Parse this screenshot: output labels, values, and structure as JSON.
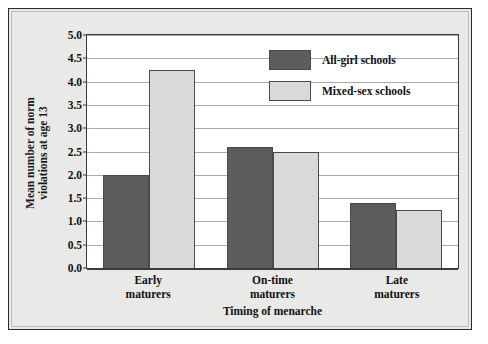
{
  "chart_data": {
    "type": "bar",
    "title": "",
    "xlabel": "Timing of menarche",
    "ylabel": "Mean number of norm\nviolations at age 13",
    "categories": [
      "Early\nmaturers",
      "On-time\nmaturers",
      "Late\nmaturers"
    ],
    "series": [
      {
        "name": "All-girl schools",
        "color": "#5c5c5c",
        "values": [
          2.0,
          2.6,
          1.4
        ]
      },
      {
        "name": "Mixed-sex schools",
        "color": "#d9d9d9",
        "values": [
          4.25,
          2.5,
          1.25
        ]
      }
    ],
    "ylim": [
      0.0,
      5.0
    ],
    "yticks": [
      "0.0",
      "0.5",
      "1.0",
      "1.5",
      "2.0",
      "2.5",
      "3.0",
      "3.5",
      "4.0",
      "4.5",
      "5.0"
    ],
    "ytick_values": [
      0.0,
      0.5,
      1.0,
      1.5,
      2.0,
      2.5,
      3.0,
      3.5,
      4.0,
      4.5,
      5.0
    ],
    "grid": true,
    "legend_position": "top-right"
  },
  "figure": {
    "panel_color": "#e9e9e7",
    "plot_background": "#ffffff",
    "border_color": "#2a2a2a",
    "gridline_color": "#a9a9a9"
  }
}
